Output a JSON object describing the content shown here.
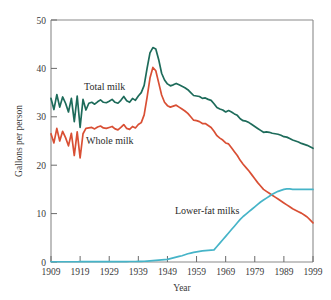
{
  "chart_data": {
    "type": "line",
    "title": "",
    "xlabel": "Year",
    "ylabel": "Gallons per person",
    "xlim": [
      1909,
      1999
    ],
    "ylim": [
      0,
      50
    ],
    "grid": false,
    "legend_position": "inline-annotations",
    "x_ticks": [
      "1909",
      "1919",
      "1929",
      "1939",
      "1949",
      "1959",
      "1969",
      "1979",
      "1989",
      "1999"
    ],
    "y_ticks": [
      "0",
      "10",
      "20",
      "30",
      "40",
      "50"
    ],
    "x": [
      1909,
      1910,
      1911,
      1912,
      1913,
      1914,
      1915,
      1916,
      1917,
      1918,
      1919,
      1920,
      1921,
      1922,
      1923,
      1924,
      1925,
      1926,
      1927,
      1928,
      1929,
      1930,
      1931,
      1932,
      1933,
      1934,
      1935,
      1936,
      1937,
      1938,
      1939,
      1940,
      1941,
      1942,
      1943,
      1944,
      1945,
      1946,
      1947,
      1948,
      1949,
      1950,
      1951,
      1952,
      1953,
      1954,
      1955,
      1956,
      1957,
      1958,
      1959,
      1960,
      1961,
      1962,
      1963,
      1964,
      1965,
      1966,
      1967,
      1968,
      1969,
      1970,
      1971,
      1972,
      1973,
      1974,
      1975,
      1976,
      1977,
      1978,
      1979,
      1980,
      1981,
      1982,
      1983,
      1984,
      1985,
      1986,
      1987,
      1988,
      1989,
      1990,
      1991,
      1992,
      1993,
      1994,
      1995,
      1996,
      1997,
      1998,
      1999
    ],
    "series": [
      {
        "name": "Total milk",
        "color": "#1d6b5a",
        "values": [
          33.8,
          31.5,
          34.6,
          32.0,
          34.1,
          32.8,
          31.0,
          33.8,
          29.0,
          34.3,
          27.8,
          33.6,
          31.4,
          32.8,
          33.0,
          32.6,
          33.1,
          33.5,
          33.0,
          32.9,
          33.2,
          33.6,
          33.0,
          32.8,
          33.4,
          34.2,
          33.3,
          33.0,
          33.8,
          33.4,
          34.3,
          35.0,
          36.5,
          40.0,
          43.2,
          44.3,
          44.0,
          41.8,
          39.0,
          37.6,
          36.8,
          36.4,
          36.6,
          36.9,
          36.6,
          36.3,
          36.0,
          35.6,
          35.0,
          34.4,
          34.3,
          34.2,
          33.8,
          33.9,
          33.6,
          33.4,
          32.7,
          31.9,
          31.6,
          31.4,
          31.0,
          31.3,
          31.0,
          30.6,
          30.3,
          29.6,
          29.2,
          29.1,
          28.8,
          28.4,
          28.0,
          27.6,
          27.2,
          26.8,
          26.9,
          26.8,
          26.6,
          26.5,
          26.4,
          26.2,
          25.9,
          25.8,
          25.5,
          25.2,
          25.0,
          24.8,
          24.5,
          24.3,
          24.1,
          23.8,
          23.5
        ]
      },
      {
        "name": "Whole milk",
        "color": "#d94f34",
        "values": [
          26.5,
          24.6,
          27.6,
          25.0,
          27.0,
          25.7,
          24.0,
          26.6,
          22.0,
          26.9,
          21.5,
          26.5,
          27.6,
          27.7,
          27.8,
          27.5,
          27.9,
          28.1,
          27.7,
          27.6,
          27.8,
          28.0,
          27.5,
          27.3,
          27.8,
          28.4,
          27.6,
          27.4,
          28.0,
          27.7,
          28.4,
          28.8,
          30.4,
          34.0,
          38.0,
          40.2,
          39.5,
          37.0,
          34.5,
          33.0,
          32.3,
          32.0,
          32.2,
          32.4,
          32.0,
          31.6,
          31.2,
          30.7,
          30.0,
          29.3,
          29.2,
          29.0,
          28.6,
          28.6,
          28.2,
          27.8,
          27.0,
          26.1,
          25.6,
          25.2,
          24.6,
          24.4,
          23.6,
          22.8,
          22.0,
          21.0,
          20.2,
          19.5,
          18.8,
          18.0,
          17.2,
          16.4,
          15.7,
          15.0,
          14.6,
          14.2,
          13.8,
          13.4,
          13.0,
          12.6,
          12.2,
          11.8,
          11.4,
          11.0,
          10.7,
          10.4,
          10.1,
          9.7,
          9.3,
          8.7,
          8.1
        ]
      },
      {
        "name": "Lower-fat milks",
        "color": "#46b4c8",
        "values": [
          0.05,
          0.05,
          0.05,
          0.05,
          0.05,
          0.05,
          0.05,
          0.05,
          0.05,
          0.05,
          0.06,
          0.06,
          0.06,
          0.06,
          0.06,
          0.06,
          0.07,
          0.07,
          0.07,
          0.07,
          0.08,
          0.08,
          0.08,
          0.08,
          0.08,
          0.09,
          0.09,
          0.1,
          0.1,
          0.1,
          0.12,
          0.14,
          0.16,
          0.2,
          0.25,
          0.3,
          0.35,
          0.4,
          0.45,
          0.5,
          0.55,
          0.7,
          0.85,
          1.0,
          1.15,
          1.3,
          1.5,
          1.7,
          1.85,
          2.0,
          2.1,
          2.2,
          2.3,
          2.35,
          2.4,
          2.45,
          2.5,
          3.2,
          3.9,
          4.6,
          5.3,
          6.0,
          6.7,
          7.4,
          8.1,
          8.8,
          9.4,
          9.9,
          10.4,
          10.9,
          11.4,
          11.9,
          12.4,
          12.8,
          13.2,
          13.6,
          14.0,
          14.3,
          14.6,
          14.8,
          15.0,
          15.1,
          15.1,
          15.0,
          15.0,
          15.0,
          15.0,
          15.0,
          15.0,
          15.0,
          15.0
        ]
      }
    ],
    "annotations": [
      {
        "text": "Total milk",
        "x_px": 84,
        "y_px": 90,
        "series": "Total milk"
      },
      {
        "text": "Whole milk",
        "x_px": 86,
        "y_px": 144,
        "series": "Whole milk"
      },
      {
        "text": "Lower-fat milks",
        "x_px": 175,
        "y_px": 214,
        "series": "Lower-fat milks"
      }
    ]
  },
  "axis": {
    "y_title": "Gallons per person",
    "x_title": "Year",
    "x_tick_labels": [
      "1909",
      "1919",
      "1929",
      "1939",
      "1949",
      "1959",
      "1969",
      "1979",
      "1989",
      "1999"
    ],
    "y_tick_labels": [
      "50",
      "40",
      "30",
      "20",
      "10",
      "0"
    ]
  },
  "colors": {
    "total_milk": "#1d6b5a",
    "whole_milk": "#d94f34",
    "lower_fat_milks": "#46b4c8",
    "frame": "#8a8a8a",
    "edge_marker": "#c8b98a",
    "background": "#ffffff"
  }
}
